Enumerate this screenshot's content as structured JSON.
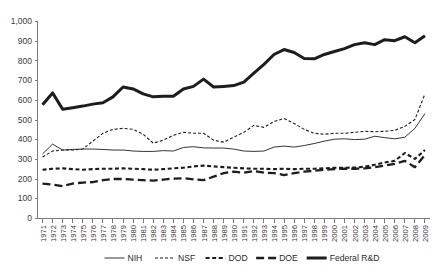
{
  "chart_data": {
    "type": "line",
    "title": "",
    "xlabel": "",
    "ylabel": "",
    "ylim": [
      0,
      1000
    ],
    "ytick_step": 100,
    "grid": false,
    "legend_position": "bottom",
    "ytick_labels": [
      "0",
      "100",
      "200",
      "300",
      "400",
      "500",
      "600",
      "700",
      "800",
      "900",
      "1,000"
    ],
    "ytick_values": [
      0,
      100,
      200,
      300,
      400,
      500,
      600,
      700,
      800,
      900,
      1000
    ],
    "categories": [
      "1971",
      "1972",
      "1973",
      "1974",
      "1975",
      "1976",
      "1977",
      "1978",
      "1979",
      "1980",
      "1981",
      "1982",
      "1983",
      "1984",
      "1985",
      "1986",
      "1987",
      "1988",
      "1989",
      "1990",
      "1991",
      "1992",
      "1993",
      "1994",
      "1995",
      "1996",
      "1997",
      "1998",
      "1999",
      "2000",
      "2001",
      "2002",
      "2003",
      "2004",
      "2005",
      "2006",
      "2007",
      "2008",
      "2009"
    ],
    "series": [
      {
        "name": "NIH",
        "style": "solid-thin",
        "color": "#1d1d1d",
        "width": 0.9,
        "dash": "none",
        "values": [
          325,
          375,
          345,
          348,
          350,
          350,
          348,
          345,
          345,
          340,
          338,
          338,
          342,
          340,
          358,
          362,
          356,
          355,
          355,
          350,
          340,
          338,
          340,
          360,
          365,
          360,
          368,
          378,
          390,
          400,
          402,
          398,
          400,
          415,
          408,
          402,
          410,
          455,
          530
        ]
      },
      {
        "name": "NSF",
        "style": "dashed-fine",
        "color": "#1d1d1d",
        "width": 1.1,
        "dash": "3,2",
        "values": [
          310,
          340,
          345,
          345,
          350,
          390,
          430,
          450,
          455,
          450,
          425,
          380,
          395,
          420,
          435,
          430,
          430,
          395,
          385,
          410,
          435,
          470,
          460,
          490,
          505,
          480,
          450,
          430,
          425,
          430,
          430,
          435,
          440,
          438,
          440,
          445,
          465,
          500,
          630
        ]
      },
      {
        "name": "DOD",
        "style": "dashed-medium",
        "color": "#1d1d1d",
        "width": 2.1,
        "dash": "4,2.6",
        "values": [
          245,
          250,
          252,
          248,
          245,
          248,
          250,
          250,
          252,
          250,
          248,
          245,
          248,
          252,
          255,
          262,
          266,
          262,
          258,
          255,
          252,
          250,
          250,
          248,
          250,
          248,
          250,
          250,
          252,
          255,
          255,
          256,
          260,
          270,
          282,
          290,
          330,
          300,
          345
        ]
      },
      {
        "name": "DOE",
        "style": "dashed-long",
        "color": "#1d1d1d",
        "width": 2.3,
        "dash": "8,4",
        "values": [
          175,
          170,
          162,
          175,
          180,
          182,
          192,
          198,
          198,
          195,
          192,
          190,
          195,
          200,
          202,
          196,
          192,
          210,
          228,
          235,
          230,
          238,
          230,
          228,
          218,
          228,
          235,
          240,
          245,
          248,
          250,
          250,
          252,
          258,
          266,
          275,
          290,
          258,
          320
        ]
      },
      {
        "name": "Federal R&D",
        "style": "solid-thick",
        "color": "#1d1d1d",
        "width": 3.0,
        "dash": "none",
        "values": [
          575,
          635,
          552,
          560,
          568,
          578,
          585,
          615,
          665,
          655,
          630,
          615,
          618,
          618,
          655,
          668,
          705,
          665,
          668,
          672,
          690,
          735,
          780,
          830,
          855,
          840,
          810,
          808,
          830,
          845,
          860,
          880,
          890,
          880,
          905,
          900,
          920,
          890,
          925
        ]
      }
    ],
    "legend": [
      {
        "label": "NIH",
        "style": "solid-thin",
        "dash": "none",
        "width": 0.9
      },
      {
        "label": "NSF",
        "style": "dashed-fine",
        "dash": "3,2",
        "width": 1.1
      },
      {
        "label": "DOD",
        "style": "dashed-medium",
        "dash": "4,2.6",
        "width": 2.1
      },
      {
        "label": "DOE",
        "style": "dashed-long",
        "dash": "8,4",
        "width": 2.3
      },
      {
        "label": "Federal R&D",
        "style": "solid-thick",
        "dash": "none",
        "width": 3.0
      }
    ]
  }
}
